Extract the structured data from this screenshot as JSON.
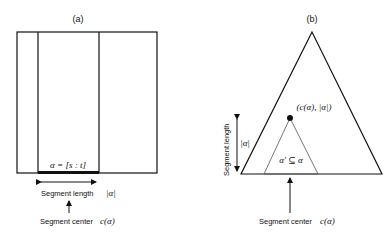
{
  "panel_a": {
    "label": "(a)",
    "segment_label": "α = [s : t]",
    "length_label": "Segment length",
    "length_symbol": "|α|",
    "center_label": "Segment center",
    "center_symbol": "c(α)"
  },
  "panel_b": {
    "label": "(b)",
    "point_label": "(c(α), |α|)",
    "subset_label": "α′ ⊆ α",
    "length_axis_label": "Segment length",
    "length_symbol": "|α|",
    "center_label": "Segment center",
    "center_symbol": "c(α)"
  },
  "colors": {
    "stroke": "#111111",
    "inner_stroke": "#555555",
    "text": "#111111"
  }
}
